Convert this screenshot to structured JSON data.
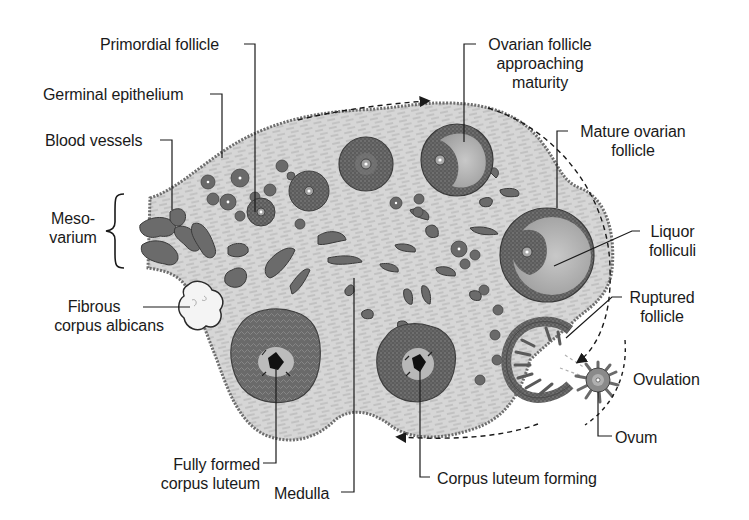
{
  "diagram": {
    "labels": {
      "primordial_follicle": "Primordial follicle",
      "germinal_epithelium": "Germinal epithelium",
      "blood_vessels": "Blood vessels",
      "mesovarium_line1": "Meso-",
      "mesovarium_line2": "varium",
      "fibrous_line1": "Fibrous",
      "fibrous_line2": "corpus albicans",
      "fully_formed_line1": "Fully formed",
      "fully_formed_line2": "corpus luteum",
      "medulla": "Medulla",
      "corpus_luteum_forming": "Corpus luteum forming",
      "ovum": "Ovum",
      "ovulation": "Ovulation",
      "ruptured_line1": "Ruptured",
      "ruptured_line2": "follicle",
      "liquor_line1": "Liquor",
      "liquor_line2": "folliculi",
      "mature_line1": "Mature ovarian",
      "mature_line2": "follicle",
      "approaching_line1": "Ovarian follicle",
      "approaching_line2": "approaching",
      "approaching_line3": "maturity"
    },
    "colors": {
      "stroma": "#d4d4d4",
      "stroma_fiber": "#9a9a9a",
      "epithelium": "#6e6e6e",
      "follicle_dark": "#5a5a5a",
      "follicle_antrum": "#b4b4b4",
      "vessel": "#6b6b6b",
      "leader_line": "#1a1a1a",
      "label_text": "#1a1a1a"
    }
  }
}
